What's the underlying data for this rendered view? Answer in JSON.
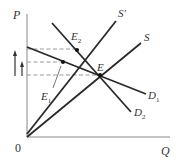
{
  "diagram": {
    "type": "supply-demand",
    "axes": {
      "y_label": "P",
      "x_label": "Q",
      "origin_label": "0"
    },
    "curves": [
      {
        "id": "S",
        "label": "S",
        "kind": "supply"
      },
      {
        "id": "S_prime",
        "label": "S′",
        "kind": "supply"
      },
      {
        "id": "D1",
        "label": "D",
        "sub": "1",
        "kind": "demand"
      },
      {
        "id": "D2",
        "label": "D",
        "sub": "2",
        "kind": "demand"
      }
    ],
    "points": [
      {
        "id": "E",
        "label": "E",
        "sub": ""
      },
      {
        "id": "E1",
        "label": "E",
        "sub": "1"
      },
      {
        "id": "E2",
        "label": "E",
        "sub": "2"
      }
    ],
    "arrows": [
      {
        "id": "price-rise-long",
        "direction": "up"
      },
      {
        "id": "price-rise-short",
        "direction": "up"
      }
    ],
    "colors": {
      "line": "#2a2a2a",
      "axis": "#777777",
      "dashed": "#999999",
      "text": "#333333"
    }
  }
}
